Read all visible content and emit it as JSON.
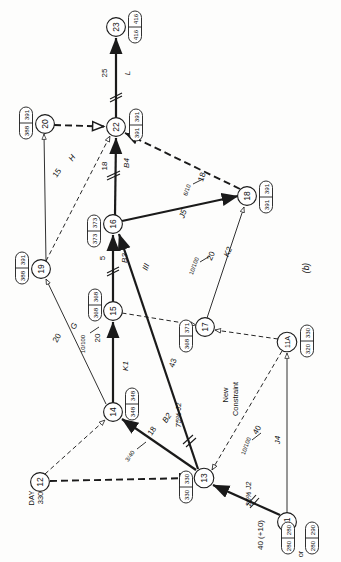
{
  "figure": {
    "label": "(b)",
    "start_note": "DAY\n330",
    "start_note_line1": "DAY",
    "start_note_line2": "330",
    "new_constraint_line1": "New",
    "new_constraint_line2": "Constraint",
    "or_label": "or"
  },
  "nodes": [
    {
      "id": "23",
      "x": 116,
      "y": 27,
      "boxes": [
        {
          "early": "416",
          "late": "416"
        }
      ]
    },
    {
      "id": "22",
      "x": 116,
      "y": 127,
      "boxes": [
        {
          "early": "391",
          "late": "391"
        }
      ]
    },
    {
      "id": "20",
      "x": 45,
      "y": 124,
      "boxes": [
        {
          "early": "388",
          "late": "391"
        }
      ]
    },
    {
      "id": "19",
      "x": 41,
      "y": 269,
      "boxes": [
        {
          "early": "388",
          "late": "391"
        }
      ]
    },
    {
      "id": "16",
      "x": 113,
      "y": 224,
      "boxes": [
        {
          "early": "373",
          "late": "373"
        }
      ]
    },
    {
      "id": "15",
      "x": 113,
      "y": 311,
      "boxes": [
        {
          "early": "368",
          "late": "368"
        }
      ]
    },
    {
      "id": "14",
      "x": 113,
      "y": 412,
      "boxes": [
        {
          "early": "348",
          "late": "348"
        }
      ]
    },
    {
      "id": "12",
      "x": 40,
      "y": 482,
      "boxes": []
    },
    {
      "id": "13",
      "x": 204,
      "y": 478,
      "boxes": [
        {
          "early": "330",
          "late": "330"
        }
      ]
    },
    {
      "id": "11",
      "x": 287,
      "y": 522,
      "boxes": [
        {
          "early": "280",
          "late": "280"
        },
        {
          "early": "280",
          "late": "290"
        }
      ]
    },
    {
      "id": "11A",
      "x": 287,
      "y": 342,
      "boxes": [
        {
          "early": "320",
          "late": "330"
        }
      ]
    },
    {
      "id": "17",
      "x": 205,
      "y": 327,
      "boxes": [
        {
          "early": "368",
          "late": "371"
        }
      ]
    },
    {
      "id": "18",
      "x": 247,
      "y": 196,
      "boxes": [
        {
          "early": "391",
          "late": "391"
        }
      ]
    }
  ],
  "activities": [
    {
      "name": "L",
      "duration": "25",
      "from": "22",
      "to": "23",
      "style": "critical"
    },
    {
      "name": "B4",
      "duration": "18",
      "from": "16",
      "to": "22",
      "style": "critical"
    },
    {
      "name": "H",
      "duration": "15",
      "from": "19",
      "to": "20",
      "style": "normal"
    },
    {
      "name": "B3",
      "duration": "5",
      "from": "15",
      "to": "16",
      "style": "critical"
    },
    {
      "name": "G",
      "duration": "20",
      "resource": "10/100",
      "resource_duration": "20",
      "from": "14",
      "to": "19",
      "style": "normal"
    },
    {
      "name": "K1",
      "duration": "20",
      "from": "14",
      "to": "15",
      "style": "critical"
    },
    {
      "name": "B2",
      "duration": "18",
      "resource": "3/40",
      "from": "13",
      "to": "14",
      "style": "critical"
    },
    {
      "name": "III",
      "duration": "43",
      "annotation": "75% J2",
      "from": "13",
      "to": "16",
      "style": "critical"
    },
    {
      "name": "J5",
      "duration": "18",
      "resource": "6/10",
      "from": "16",
      "to": "18",
      "style": "critical"
    },
    {
      "name": "K2",
      "duration": "20",
      "resource": "10/100",
      "from": "17",
      "to": "18",
      "style": "normal"
    },
    {
      "name": "J4",
      "duration": "40",
      "resource": "10/100",
      "from": "11",
      "to": "11A",
      "style": "normal"
    },
    {
      "name": "",
      "duration": "40 (+10)",
      "annotation": "25% J2",
      "from": "11",
      "to": "13",
      "style": "critical"
    }
  ],
  "dummies": [
    {
      "from": "20",
      "to": "22",
      "kind": "heavy"
    },
    {
      "from": "19",
      "to": "22",
      "kind": "light"
    },
    {
      "from": "18",
      "to": "22",
      "kind": "heavy"
    },
    {
      "from": "15",
      "to": "17",
      "kind": "light"
    },
    {
      "from": "13",
      "to": "17",
      "kind": "light"
    },
    {
      "from": "11A",
      "to": "17",
      "kind": "light"
    },
    {
      "from": "11A",
      "to": "13",
      "kind": "light"
    },
    {
      "from": "12",
      "to": "14",
      "kind": "light"
    },
    {
      "from": "12",
      "to": "13",
      "kind": "heavy"
    }
  ]
}
